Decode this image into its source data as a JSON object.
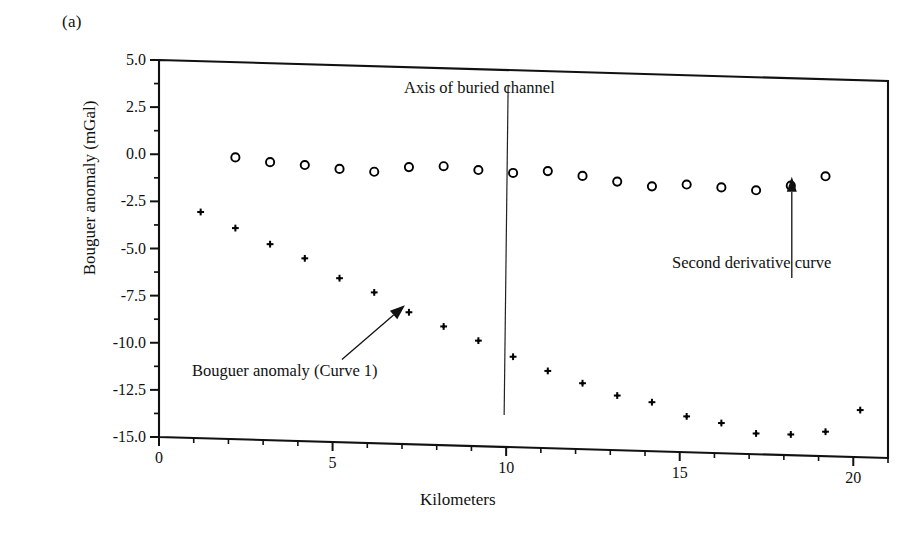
{
  "figure": {
    "panel_label": "(a)"
  },
  "chart_data": {
    "type": "scatter",
    "title": "",
    "xlabel": "Kilometers",
    "ylabel": "Bouguer anomaly (mGal)",
    "xlim": [
      0,
      21
    ],
    "ylim": [
      -15.0,
      5.0
    ],
    "grid": false,
    "legend_position": "none",
    "x_ticks": [
      0,
      5,
      10,
      15,
      20
    ],
    "x_tick_labels": [
      "0",
      "5",
      "10",
      "15",
      "20"
    ],
    "x_minor_tick_interval": 1,
    "y_ticks": [
      5.0,
      2.5,
      0.0,
      -2.5,
      -5.0,
      -7.5,
      -10.0,
      -12.5,
      -15.0
    ],
    "y_tick_labels": [
      "5.0",
      "2.5",
      "0.0",
      "-2.5",
      "-5.0",
      "-7.5",
      "-10.0",
      "-12.5",
      "-15.0"
    ],
    "y_minor_tick_interval": 1.25,
    "series": [
      {
        "name": "Second derivative curve",
        "marker": "open-circle",
        "color": "#000000",
        "x": [
          2.2,
          3.2,
          4.2,
          5.2,
          6.2,
          7.2,
          8.2,
          9.2,
          10.2,
          11.2,
          12.2,
          13.2,
          14.2,
          15.2,
          16.2,
          17.2,
          18.2,
          19.2
        ],
        "y": [
          -0.05,
          -0.25,
          -0.35,
          -0.5,
          -0.6,
          -0.3,
          -0.2,
          -0.35,
          -0.45,
          -0.3,
          -0.5,
          -0.75,
          -0.95,
          -0.8,
          -0.9,
          -1.0,
          -0.7,
          -0.15
        ]
      },
      {
        "name": "Bouguer anomaly (Curve 1)",
        "marker": "plus",
        "color": "#000000",
        "x": [
          1.2,
          2.2,
          3.2,
          4.2,
          5.2,
          6.2,
          7.2,
          8.2,
          9.2,
          10.2,
          11.2,
          12.2,
          13.2,
          14.2,
          15.2,
          16.2,
          17.2,
          18.2,
          19.2,
          20.2
        ],
        "y": [
          -3.0,
          -3.8,
          -4.6,
          -5.3,
          -6.3,
          -7.0,
          -8.0,
          -8.7,
          -9.4,
          -10.2,
          -10.9,
          -11.5,
          -12.1,
          -12.4,
          -13.1,
          -13.4,
          -13.9,
          -13.9,
          -13.7,
          -12.5
        ]
      }
    ],
    "annotations": [
      {
        "id": "axis-of-buried-channel",
        "text": "Axis of buried channel",
        "marker_type": "vertical-line",
        "x": 10.0,
        "y_top": 4.2,
        "y_bottom": -13.3
      },
      {
        "id": "bouguer-anomaly-curve-1",
        "text": "Bouguer anomaly (Curve 1)",
        "marker_type": "arrow",
        "points_to_x": 7.2,
        "points_to_y": -8.0
      },
      {
        "id": "second-derivative-curve",
        "text": "Second derivative curve",
        "marker_type": "arrow",
        "points_to_x": 18.2,
        "points_to_y": -0.7
      }
    ]
  }
}
